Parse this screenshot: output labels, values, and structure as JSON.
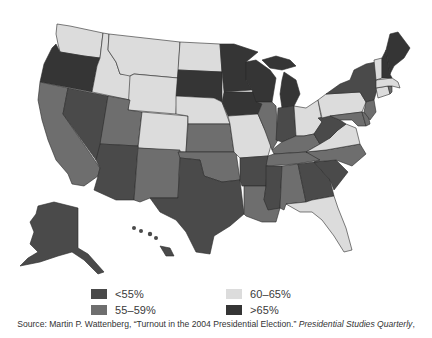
{
  "legend": {
    "items": [
      {
        "label": "<55%",
        "color": "#4a4a4a"
      },
      {
        "label": "55–59%",
        "color": "#6e6e6e"
      },
      {
        "label": "60–65%",
        "color": "#dcdcdc"
      },
      {
        "label": ">65%",
        "color": "#353535"
      }
    ]
  },
  "source": {
    "prefix": "Source: Martin P. Wattenberg, “Turnout in the 2004 Presidential Election.” ",
    "journal": "Presidential Studies Quarterly",
    "suffix": ","
  },
  "map": {
    "title": "US voter turnout by state, 2004",
    "categories": {
      "WA": "60–65%",
      "OR": ">65%",
      "CA": "55–59%",
      "NV": "<55%",
      "ID": "60–65%",
      "MT": "60–65%",
      "WY": "60–65%",
      "UT": "55–59%",
      "CO": "60–65%",
      "AZ": "<55%",
      "NM": "55–59%",
      "ND": "60–65%",
      "SD": ">65%",
      "NE": "60–65%",
      "KS": "55–59%",
      "OK": "55–59%",
      "TX": "<55%",
      "MN": ">65%",
      "IA": ">65%",
      "MO": "60–65%",
      "AR": "<55%",
      "LA": "55–59%",
      "WI": ">65%",
      "IL": "55–59%",
      "MI": ">65%",
      "IN": "<55%",
      "OH": "60–65%",
      "KY": "55–59%",
      "TN": "55–59%",
      "MS": "<55%",
      "AL": "55–59%",
      "GA": "<55%",
      "FL": "60–65%",
      "SC": "<55%",
      "NC": "55–59%",
      "VA": "60–65%",
      "WV": "<55%",
      "PA": "60–65%",
      "NY": "<55%",
      "VT": "60–65%",
      "NH": ">65%",
      "ME": ">65%",
      "MA": "60–65%",
      "RI": "55–59%",
      "CT": "60–65%",
      "NJ": "55–59%",
      "DE": "55–59%",
      "MD": "55–59%",
      "AK": "<55%",
      "HI": "<55%"
    }
  }
}
